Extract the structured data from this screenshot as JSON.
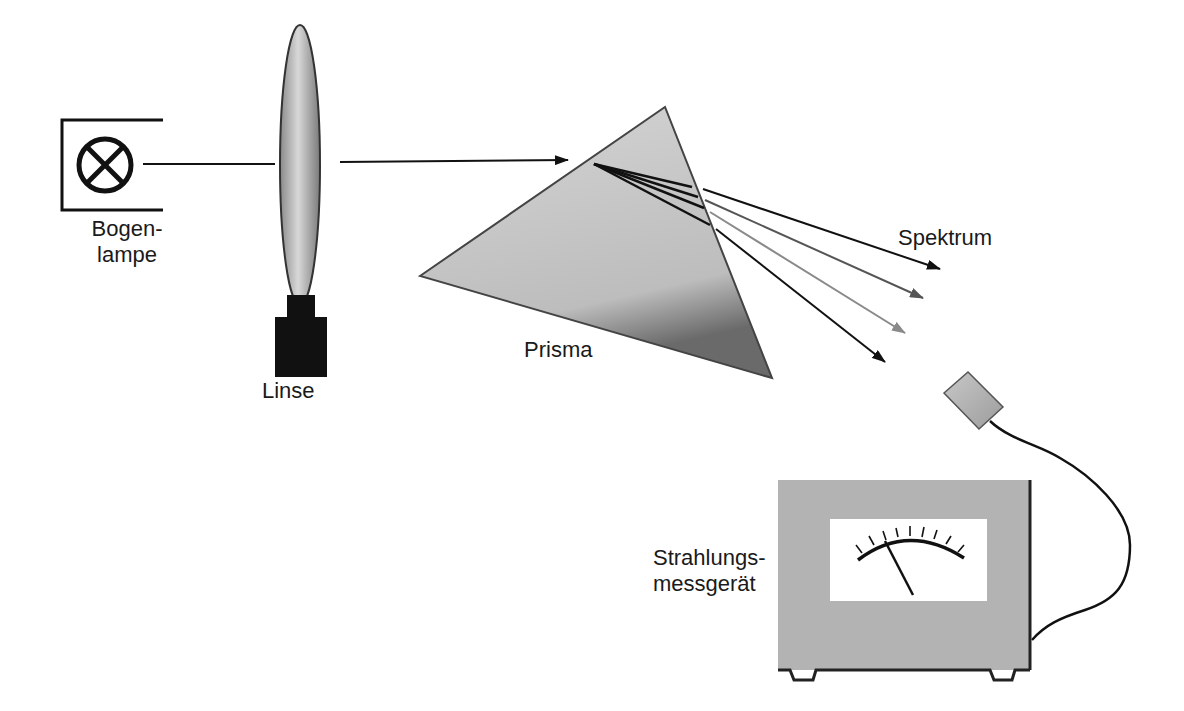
{
  "components": {
    "lamp": {
      "label_line1": "Bogen-",
      "label_line2": "lampe",
      "icon": "lamp-cross-circle-icon"
    },
    "lens": {
      "label": "Linse"
    },
    "prism": {
      "label": "Prisma"
    },
    "spectrum": {
      "label": "Spektrum",
      "ray_count": 4
    },
    "meter": {
      "label_line1": "Strahlungs-",
      "label_line2": "messgerät",
      "tick_count": 9
    }
  },
  "colors": {
    "line": "#111111",
    "prism_fill": "#c6c6c6",
    "lens_fill": "#b9b9b9",
    "meter_fill": "#b3b3b3",
    "ray_colors": [
      "#111111",
      "#555555",
      "#8a8a8a",
      "#111111"
    ]
  }
}
